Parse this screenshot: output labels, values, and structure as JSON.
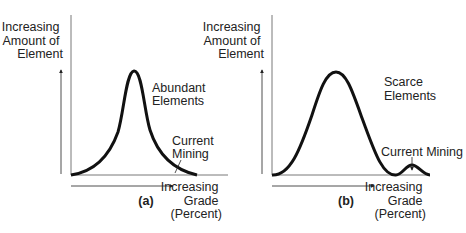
{
  "panels": [
    {
      "id": "a",
      "caption": "(a)",
      "y_axis_label": [
        "Increasing",
        "Amount of",
        "Element"
      ],
      "x_axis_label": [
        "Increasing",
        "Grade",
        "(Percent)"
      ],
      "curve_label": [
        "Abundant",
        "Elements"
      ],
      "mining_label": [
        "Current",
        "Mining"
      ],
      "curve_shape": "single sharp peak, long right tail; current mining at right tail"
    },
    {
      "id": "b",
      "caption": "(b)",
      "y_axis_label": [
        "Increasing",
        "Amount of",
        "Element"
      ],
      "x_axis_label": [
        "Increasing",
        "Grade",
        "(Percent)"
      ],
      "curve_label": [
        "Scarce",
        "Elements"
      ],
      "mining_label": [
        "Current Mining"
      ],
      "curve_shape": "broad peak at low grade, dip, small secondary bump at high grade where current mining occurs"
    }
  ],
  "colors": {
    "line": "#111111",
    "text": "#222222",
    "background": "#ffffff"
  }
}
